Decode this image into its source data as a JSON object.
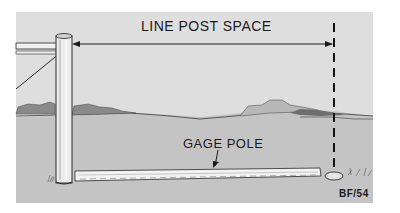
{
  "diagram": {
    "labels": {
      "line_post_space": "LINE POST SPACE",
      "gage_pole": "GAGE POLE",
      "reference_code": "BF/54"
    },
    "colors": {
      "sky": "#dedede",
      "ground": "#c4c4c4",
      "hills": "#8a8a8a",
      "outline": "#2a2a2a",
      "wood": "#f0f0f0"
    },
    "elements": [
      "corner-post",
      "fence-rails",
      "brace-wire",
      "dimension-arrow",
      "dashed-marker-line",
      "gage-pole",
      "stake",
      "hills",
      "grass-tufts"
    ]
  }
}
